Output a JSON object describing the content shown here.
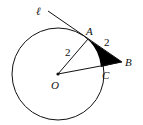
{
  "diagram": {
    "type": "geometry",
    "labels": {
      "line": "ℓ",
      "A": "A",
      "B": "B",
      "C": "C",
      "O": "O",
      "OA_length": "2",
      "AB_length": "2"
    },
    "colors": {
      "stroke": "#111111",
      "shaded_region": "#000000",
      "background": "#ffffff"
    }
  }
}
